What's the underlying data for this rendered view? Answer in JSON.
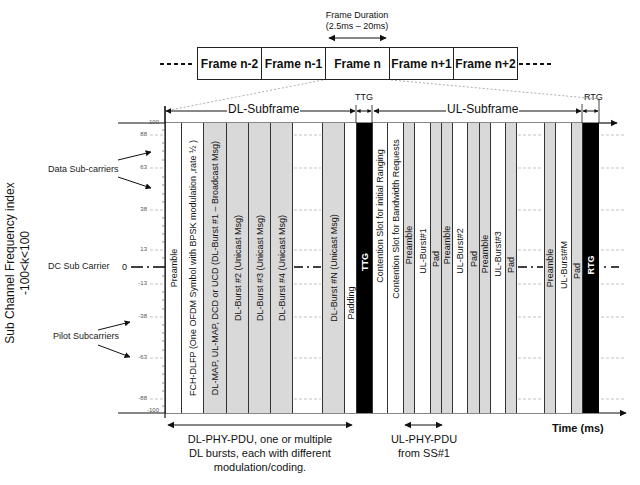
{
  "top": {
    "frame_duration_label": "Frame Duration",
    "frame_duration_range": "(2.5ms – 20ms)",
    "frames": [
      {
        "label": "Frame n-2",
        "left": 197,
        "width": 64
      },
      {
        "label": "Frame n-1",
        "left": 261,
        "width": 64
      },
      {
        "label": "Frame n",
        "left": 325,
        "width": 64
      },
      {
        "label": "Frame n+1",
        "left": 389,
        "width": 64
      },
      {
        "label": "Frame n+2",
        "left": 453,
        "width": 64
      }
    ],
    "ellipsis": "-----"
  },
  "subframes": {
    "dl": "DL-Subframe",
    "ul": "UL-Subframe",
    "ttg": "TTG",
    "rtg": "RTG"
  },
  "axis": {
    "ylabel_line1": "Sub Channel Frequency index",
    "ylabel_line2": "-100<k<100",
    "xlabel": "Time (ms)",
    "ticks": [
      {
        "label": "100",
        "y": 124
      },
      {
        "label": "88",
        "y": 135
      },
      {
        "label": "63",
        "y": 168
      },
      {
        "label": "38",
        "y": 210
      },
      {
        "label": "13",
        "y": 250
      },
      {
        "label": "0",
        "y": 267
      },
      {
        "label": "-13",
        "y": 284
      },
      {
        "label": "-38",
        "y": 317
      },
      {
        "label": "-63",
        "y": 358
      },
      {
        "label": "-88",
        "y": 399
      },
      {
        "label": "-100",
        "y": 412
      }
    ]
  },
  "annotations": {
    "data_subcarriers": "Data Sub-carriers",
    "dc_subcarrier": "DC Sub Carrier",
    "pilot_subcarriers": "Pilot Subcarriers"
  },
  "columns": [
    {
      "label": "Preamble",
      "left": 165,
      "width": 16,
      "fill": "white"
    },
    {
      "label": "FCH-DLFP (One OFDM Symbol with BPSK modulation ,rate ½ )",
      "left": 181,
      "width": 22,
      "fill": "white"
    },
    {
      "label": "DL-MAP, UL-MAP, DCD or UCD (DL-Burst #1 – Broadcast Msg)",
      "left": 203,
      "width": 23,
      "fill": "gray"
    },
    {
      "label": "DL-Burst #2 (Unicast Msg)",
      "left": 226,
      "width": 22,
      "fill": "gray"
    },
    {
      "label": "DL-Burst #3 (Unicast Msg)",
      "left": 248,
      "width": 22,
      "fill": "gray"
    },
    {
      "label": "DL-Burst #4 (Unicast Msg)",
      "left": 270,
      "width": 22,
      "fill": "gray"
    },
    {
      "label": "",
      "left": 292,
      "width": 30,
      "fill": "white"
    },
    {
      "label": "DL-Burst #N (Unicast Msg)",
      "left": 322,
      "width": 22,
      "fill": "gray"
    },
    {
      "label": "Padding",
      "left": 344,
      "width": 12,
      "fill": "white"
    },
    {
      "label": "TTG",
      "left": 356,
      "width": 16,
      "fill": "black"
    },
    {
      "label": "Contention Slot for initial Ranging",
      "left": 372,
      "width": 15,
      "fill": "white"
    },
    {
      "label": "Contention Slot for Bandwidth Requests",
      "left": 387,
      "width": 16,
      "fill": "white"
    },
    {
      "label": "Preamble",
      "left": 403,
      "width": 11,
      "fill": "gray"
    },
    {
      "label": "UL-Burst#1",
      "left": 414,
      "width": 16,
      "fill": "white"
    },
    {
      "label": "Pad",
      "left": 430,
      "width": 11,
      "fill": "gray"
    },
    {
      "label": "Preamble",
      "left": 441,
      "width": 11,
      "fill": "gray"
    },
    {
      "label": "UL-Burst#2",
      "left": 452,
      "width": 15,
      "fill": "white"
    },
    {
      "label": "Pad",
      "left": 467,
      "width": 12,
      "fill": "gray"
    },
    {
      "label": "Preamble",
      "left": 479,
      "width": 11,
      "fill": "gray"
    },
    {
      "label": "UL-Burst#3",
      "left": 490,
      "width": 15,
      "fill": "white"
    },
    {
      "label": "Pad",
      "left": 505,
      "width": 11,
      "fill": "gray"
    },
    {
      "label": "",
      "left": 516,
      "width": 28,
      "fill": "white"
    },
    {
      "label": "Preamble",
      "left": 544,
      "width": 11,
      "fill": "gray"
    },
    {
      "label": "UL-Burst#M",
      "left": 555,
      "width": 16,
      "fill": "white"
    },
    {
      "label": "Pad",
      "left": 571,
      "width": 11,
      "fill": "gray"
    },
    {
      "label": "RTG",
      "left": 582,
      "width": 17,
      "fill": "black"
    }
  ],
  "bottom": {
    "dl_pdu_line1": "DL-PHY-PDU, one or multiple",
    "dl_pdu_line2": "DL bursts, each with different",
    "dl_pdu_line3": "modulation/coding.",
    "ul_pdu_line1": "UL-PHY-PDU",
    "ul_pdu_line2": "from SS#1"
  }
}
